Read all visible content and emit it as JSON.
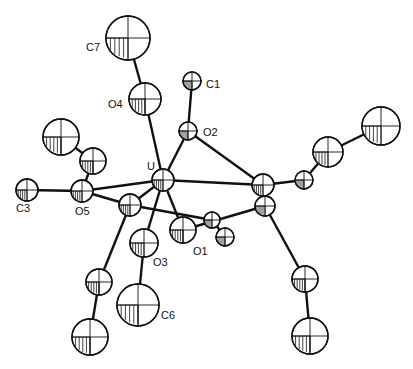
{
  "figure": {
    "type": "ORTEP thermal-ellipsoid molecular structure",
    "width": 413,
    "height": 369,
    "background": "#ffffff",
    "ink": "#111111"
  },
  "atoms": [
    {
      "id": "C7",
      "label": "C7",
      "x": 128,
      "y": 38,
      "r": 22,
      "label_x": 86,
      "label_y": 51
    },
    {
      "id": "O4",
      "label": "O4",
      "x": 145,
      "y": 99,
      "r": 16,
      "label_x": 108,
      "label_y": 108
    },
    {
      "id": "C1",
      "label": "C1",
      "x": 192,
      "y": 81,
      "r": 9,
      "label_x": 206,
      "label_y": 88
    },
    {
      "id": "O2",
      "label": "O2",
      "x": 188,
      "y": 131,
      "r": 9,
      "label_x": 203,
      "label_y": 136
    },
    {
      "id": "U",
      "label": "U",
      "x": 163,
      "y": 180,
      "r": 11,
      "label_x": 147,
      "label_y": 170
    },
    {
      "id": "M2",
      "label": "",
      "x": 263,
      "y": 185,
      "r": 11,
      "label_x": 0,
      "label_y": 0
    },
    {
      "id": "M2b",
      "label": "",
      "x": 265,
      "y": 206,
      "r": 10,
      "label_x": 0,
      "label_y": 0
    },
    {
      "id": "Ra",
      "label": "",
      "x": 304,
      "y": 180,
      "r": 9,
      "label_x": 0,
      "label_y": 0
    },
    {
      "id": "Rb",
      "label": "",
      "x": 328,
      "y": 152,
      "r": 15,
      "label_x": 0,
      "label_y": 0
    },
    {
      "id": "Rc",
      "label": "",
      "x": 381,
      "y": 126,
      "r": 19,
      "label_x": 0,
      "label_y": 0
    },
    {
      "id": "L1",
      "label": "",
      "x": 61,
      "y": 137,
      "r": 18,
      "label_x": 0,
      "label_y": 0
    },
    {
      "id": "L2",
      "label": "",
      "x": 93,
      "y": 161,
      "r": 13,
      "label_x": 0,
      "label_y": 0
    },
    {
      "id": "C3",
      "label": "C3",
      "x": 27,
      "y": 190,
      "r": 11,
      "label_x": 16,
      "label_y": 212
    },
    {
      "id": "O5",
      "label": "O5",
      "x": 82,
      "y": 191,
      "r": 11,
      "label_x": 75,
      "label_y": 215
    },
    {
      "id": "M1",
      "label": "",
      "x": 130,
      "y": 205,
      "r": 11,
      "label_x": 0,
      "label_y": 0
    },
    {
      "id": "O1",
      "label": "O1",
      "x": 183,
      "y": 230,
      "r": 13,
      "label_x": 193,
      "label_y": 255
    },
    {
      "id": "X1",
      "label": "",
      "x": 212,
      "y": 220,
      "r": 8,
      "label_x": 0,
      "label_y": 0
    },
    {
      "id": "X2",
      "label": "",
      "x": 225,
      "y": 237,
      "r": 9,
      "label_x": 0,
      "label_y": 0
    },
    {
      "id": "O3",
      "label": "O3",
      "x": 144,
      "y": 243,
      "r": 14,
      "label_x": 153,
      "label_y": 266
    },
    {
      "id": "C6",
      "label": "C6",
      "x": 138,
      "y": 305,
      "r": 21,
      "label_x": 161,
      "label_y": 319
    },
    {
      "id": "B1",
      "label": "",
      "x": 99,
      "y": 282,
      "r": 13,
      "label_x": 0,
      "label_y": 0
    },
    {
      "id": "B2",
      "label": "",
      "x": 90,
      "y": 337,
      "r": 18,
      "label_x": 0,
      "label_y": 0
    },
    {
      "id": "D1",
      "label": "",
      "x": 305,
      "y": 279,
      "r": 13,
      "label_x": 0,
      "label_y": 0
    },
    {
      "id": "D2",
      "label": "",
      "x": 310,
      "y": 336,
      "r": 18,
      "label_x": 0,
      "label_y": 0
    }
  ],
  "bonds": [
    [
      "C7",
      "O4"
    ],
    [
      "O4",
      "U"
    ],
    [
      "C1",
      "O2"
    ],
    [
      "O2",
      "U"
    ],
    [
      "O2",
      "M2"
    ],
    [
      "U",
      "M2"
    ],
    [
      "U",
      "O5"
    ],
    [
      "U",
      "O1"
    ],
    [
      "U",
      "O3"
    ],
    [
      "U",
      "M1"
    ],
    [
      "M2",
      "Ra"
    ],
    [
      "Ra",
      "Rb"
    ],
    [
      "Rb",
      "Rc"
    ],
    [
      "M2b",
      "O1"
    ],
    [
      "M2b",
      "D1"
    ],
    [
      "D1",
      "D2"
    ],
    [
      "L1",
      "L2"
    ],
    [
      "L2",
      "O5"
    ],
    [
      "C3",
      "O5"
    ],
    [
      "O5",
      "M1"
    ],
    [
      "M1",
      "X1"
    ],
    [
      "X1",
      "X2"
    ],
    [
      "M1",
      "B1"
    ],
    [
      "B1",
      "B2"
    ],
    [
      "O3",
      "C6"
    ],
    [
      "M2",
      "M2b"
    ]
  ],
  "labels": [
    "C7",
    "O4",
    "C1",
    "O2",
    "U",
    "C3",
    "O5",
    "O1",
    "O3",
    "C6"
  ]
}
